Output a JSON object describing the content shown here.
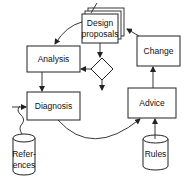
{
  "diagram": {
    "nodes": {
      "design_proposals": {
        "line1": "Design",
        "line2": "proposals",
        "shape": "stacked-documents"
      },
      "analysis": {
        "label": "Analysis",
        "shape": "rectangle"
      },
      "change": {
        "label": "Change",
        "shape": "rectangle"
      },
      "decision": {
        "label": "",
        "shape": "diamond"
      },
      "diagnosis": {
        "label": "Diagnosis",
        "shape": "rectangle"
      },
      "advice": {
        "label": "Advice",
        "shape": "rectangle"
      },
      "references": {
        "line1": "Refer-",
        "line2": "ences",
        "shape": "cylinder"
      },
      "rules": {
        "label": "Rules",
        "shape": "cylinder"
      }
    },
    "edges": [
      {
        "from": "design_proposals",
        "to": "analysis",
        "style": "curved"
      },
      {
        "from": "design_proposals",
        "to": "decision",
        "style": "straight"
      },
      {
        "from": "decision",
        "to": "analysis",
        "style": "straight"
      },
      {
        "from": "decision",
        "to": "down",
        "style": "straight"
      },
      {
        "from": "analysis",
        "to": "diagnosis",
        "style": "straight"
      },
      {
        "from": "diagnosis",
        "to": "advice",
        "style": "curved"
      },
      {
        "from": "advice",
        "to": "change",
        "style": "straight"
      },
      {
        "from": "change",
        "to": "design_proposals",
        "style": "straight"
      },
      {
        "from": "rules",
        "to": "advice",
        "style": "straight"
      },
      {
        "from": "references",
        "to": "diagnosis",
        "style": "wavy"
      },
      {
        "from": "external",
        "to": "diagnosis",
        "style": "straight"
      },
      {
        "from": "external",
        "to": "design_proposals",
        "style": "straight"
      }
    ],
    "colors": {
      "stroke": "#222222",
      "background": "#ffffff"
    }
  }
}
